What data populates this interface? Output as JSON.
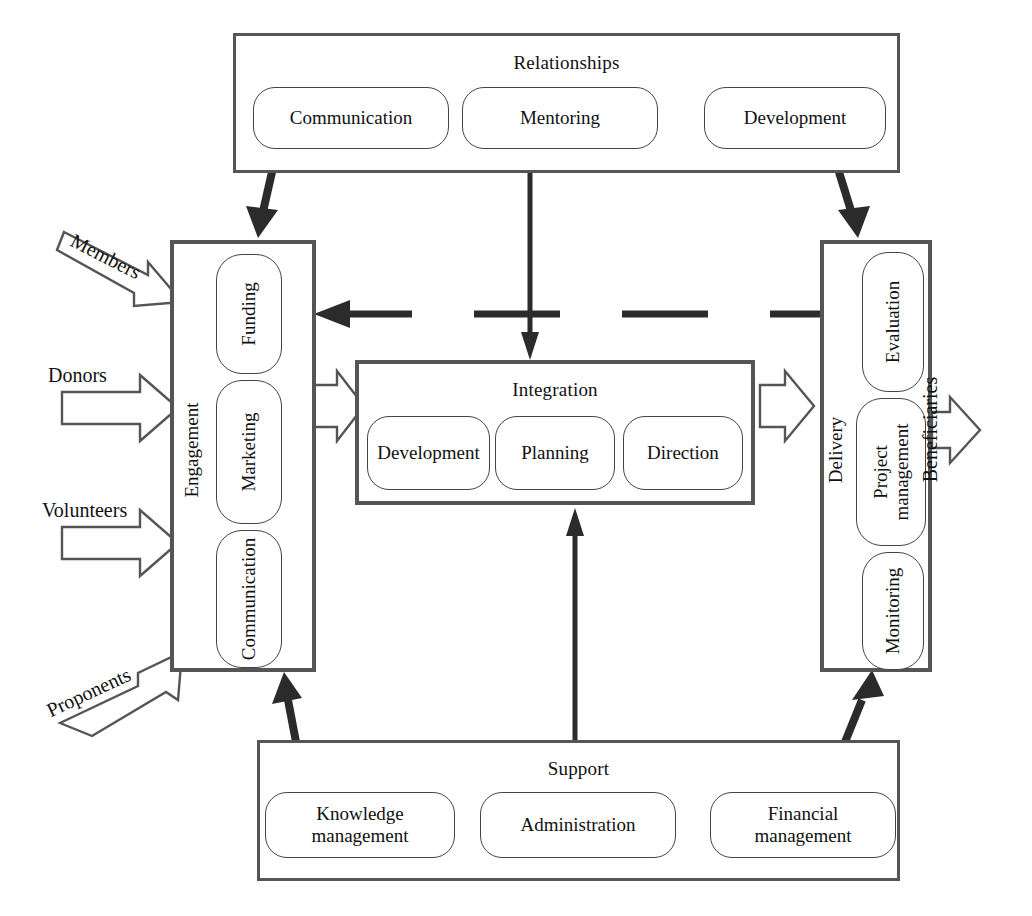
{
  "diagram": {
    "groups": {
      "relationships": {
        "label": "Relationships",
        "items": [
          "Communication",
          "Mentoring",
          "Development"
        ]
      },
      "engagement": {
        "label": "Engagement",
        "items": [
          "Funding",
          "Marketing",
          "Communication"
        ]
      },
      "integration": {
        "label": "Integration",
        "items": [
          "Development",
          "Planning",
          "Direction"
        ]
      },
      "delivery": {
        "label": "Delivery",
        "items": [
          "Evaluation",
          "Project management",
          "Monitoring"
        ]
      },
      "support": {
        "label": "Support",
        "items": [
          "Knowledge management",
          "Administration",
          "Financial management"
        ]
      }
    },
    "inputs": [
      {
        "label": "Members",
        "style": "diagonal-down"
      },
      {
        "label": "Donors",
        "style": "horizontal"
      },
      {
        "label": "Volunteers",
        "style": "horizontal"
      },
      {
        "label": "Proponents",
        "style": "diagonal-up"
      }
    ],
    "outputs": [
      {
        "label": "Beneficiaries",
        "style": "horizontal-rotated"
      }
    ],
    "connectors": [
      {
        "name": "relationships-to-engagement",
        "style": "solid-arrow-diagonal"
      },
      {
        "name": "relationships-to-integration",
        "style": "solid-arrow-vertical"
      },
      {
        "name": "relationships-to-delivery",
        "style": "solid-arrow-diagonal"
      },
      {
        "name": "engagement-to-integration",
        "style": "hollow-arrow-right"
      },
      {
        "name": "integration-to-delivery",
        "style": "hollow-arrow-right"
      },
      {
        "name": "delivery-to-engagement-feedback",
        "style": "dashed-arrow-left"
      },
      {
        "name": "support-to-engagement",
        "style": "solid-arrow-diagonal"
      },
      {
        "name": "support-to-integration",
        "style": "solid-arrow-vertical"
      },
      {
        "name": "support-to-delivery",
        "style": "solid-arrow-diagonal"
      }
    ],
    "colors": {
      "outline": "#555555",
      "pill_outline": "#444444",
      "arrow_solid": "#2b2b2b",
      "arrow_hollow_stroke": "#555555",
      "background": "#ffffff"
    }
  }
}
